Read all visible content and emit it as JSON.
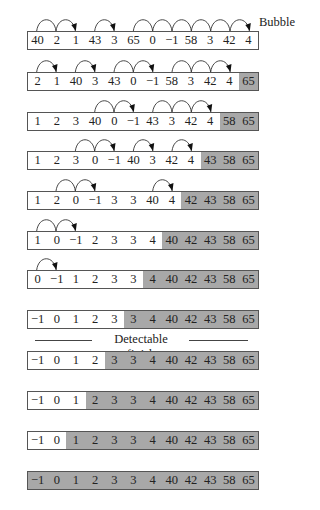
{
  "title_label": "Bubble",
  "divider_label": "Detectable finish",
  "colors": {
    "sorted": "#a8a8a8",
    "unsorted": "#ffffff",
    "border": "#555555"
  },
  "passes": [
    {
      "top": 31,
      "values": [
        "40",
        "2",
        "1",
        "43",
        "3",
        "65",
        "0",
        "−1",
        "58",
        "3",
        "42",
        "4"
      ],
      "sorted_from": 12,
      "arcs": [
        [
          0,
          1,
          0
        ],
        [
          1,
          2,
          1
        ],
        [
          3,
          4,
          1
        ],
        [
          5,
          6,
          0
        ],
        [
          6,
          7,
          0
        ],
        [
          7,
          8,
          0
        ],
        [
          8,
          9,
          0
        ],
        [
          9,
          10,
          0
        ],
        [
          10,
          11,
          1
        ]
      ]
    },
    {
      "top": 72,
      "values": [
        "2",
        "1",
        "40",
        "3",
        "43",
        "0",
        "−1",
        "58",
        "3",
        "42",
        "4",
        "65"
      ],
      "sorted_from": 11,
      "arcs": [
        [
          0,
          1,
          1
        ],
        [
          2,
          3,
          1
        ],
        [
          4,
          5,
          0
        ],
        [
          5,
          6,
          1
        ],
        [
          7,
          8,
          0
        ],
        [
          8,
          9,
          0
        ],
        [
          9,
          10,
          1
        ]
      ]
    },
    {
      "top": 112,
      "values": [
        "1",
        "2",
        "3",
        "40",
        "0",
        "−1",
        "43",
        "3",
        "42",
        "4",
        "58",
        "65"
      ],
      "sorted_from": 10,
      "arcs": [
        [
          3,
          4,
          0
        ],
        [
          4,
          5,
          1
        ],
        [
          6,
          7,
          0
        ],
        [
          7,
          8,
          0
        ],
        [
          8,
          9,
          1
        ]
      ]
    },
    {
      "top": 151,
      "values": [
        "1",
        "2",
        "3",
        "0",
        "−1",
        "40",
        "3",
        "42",
        "4",
        "43",
        "58",
        "65"
      ],
      "sorted_from": 9,
      "arcs": [
        [
          2,
          3,
          0
        ],
        [
          3,
          4,
          1
        ],
        [
          5,
          6,
          1
        ],
        [
          7,
          8,
          1
        ]
      ]
    },
    {
      "top": 191,
      "values": [
        "1",
        "2",
        "0",
        "−1",
        "3",
        "3",
        "40",
        "4",
        "42",
        "43",
        "58",
        "65"
      ],
      "sorted_from": 8,
      "arcs": [
        [
          1,
          2,
          0
        ],
        [
          2,
          3,
          1
        ],
        [
          6,
          7,
          1
        ]
      ]
    },
    {
      "top": 231,
      "values": [
        "1",
        "0",
        "−1",
        "2",
        "3",
        "3",
        "4",
        "40",
        "42",
        "43",
        "58",
        "65"
      ],
      "sorted_from": 7,
      "arcs": [
        [
          0,
          1,
          0
        ],
        [
          1,
          2,
          1
        ]
      ]
    },
    {
      "top": 270,
      "values": [
        "0",
        "−1",
        "1",
        "2",
        "3",
        "3",
        "4",
        "40",
        "42",
        "43",
        "58",
        "65"
      ],
      "sorted_from": 6,
      "arcs": [
        [
          0,
          1,
          1
        ]
      ]
    },
    {
      "top": 310,
      "values": [
        "−1",
        "0",
        "1",
        "2",
        "3",
        "3",
        "4",
        "40",
        "42",
        "43",
        "58",
        "65"
      ],
      "sorted_from": 5,
      "arcs": []
    },
    {
      "top": 351,
      "values": [
        "−1",
        "0",
        "1",
        "2",
        "3",
        "3",
        "4",
        "40",
        "42",
        "43",
        "58",
        "65"
      ],
      "sorted_from": 4,
      "arcs": []
    },
    {
      "top": 391,
      "values": [
        "−1",
        "0",
        "1",
        "2",
        "3",
        "3",
        "4",
        "40",
        "42",
        "43",
        "58",
        "65"
      ],
      "sorted_from": 3,
      "arcs": []
    },
    {
      "top": 431,
      "values": [
        "−1",
        "0",
        "1",
        "2",
        "3",
        "3",
        "4",
        "40",
        "42",
        "43",
        "58",
        "65"
      ],
      "sorted_from": 2,
      "arcs": []
    },
    {
      "top": 471,
      "values": [
        "−1",
        "0",
        "1",
        "2",
        "3",
        "3",
        "4",
        "40",
        "42",
        "43",
        "58",
        "65"
      ],
      "sorted_from": 0,
      "arcs": []
    }
  ]
}
